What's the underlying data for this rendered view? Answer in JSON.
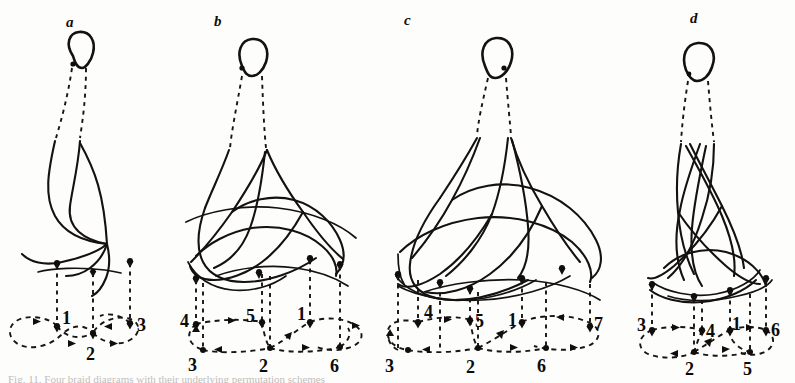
{
  "figure": {
    "background_color": "#fdfdfc",
    "ink_color": "#141110",
    "caption_partial": "Fig. 11. Four braid diagrams with their underlying permutation schemes",
    "panels": [
      {
        "id": "a",
        "letter": "a",
        "strand_count": 3,
        "top_nodes": [
          "1",
          "2",
          "3"
        ],
        "bottom_nodes": [
          "1",
          "2",
          "3"
        ],
        "upper_labels": [
          "1",
          "3"
        ],
        "lower_labels": [
          "2"
        ],
        "all_labels": [
          "1",
          "2",
          "3"
        ],
        "loop_count": 2
      },
      {
        "id": "b",
        "letter": "b",
        "strand_count": 6,
        "upper_labels": [
          "4",
          "5",
          "1"
        ],
        "lower_labels": [
          "3",
          "2",
          "6"
        ],
        "all_labels": [
          "4",
          "5",
          "1",
          "3",
          "2",
          "6"
        ],
        "loop_count": 3
      },
      {
        "id": "c",
        "letter": "c",
        "strand_count": 7,
        "upper_labels": [
          "4",
          "5",
          "1"
        ],
        "lower_labels": [
          "3",
          "2",
          "6"
        ],
        "right_label": "7",
        "all_labels": [
          "4",
          "5",
          "1",
          "3",
          "2",
          "6",
          "7"
        ],
        "loop_count": 3
      },
      {
        "id": "d",
        "letter": "d",
        "strand_count": 6,
        "upper_labels": [
          "3",
          "4",
          "1",
          "6"
        ],
        "lower_labels": [
          "2",
          "5"
        ],
        "all_labels": [
          "3",
          "4",
          "1",
          "6",
          "2",
          "5"
        ],
        "loop_count": 2
      }
    ]
  }
}
